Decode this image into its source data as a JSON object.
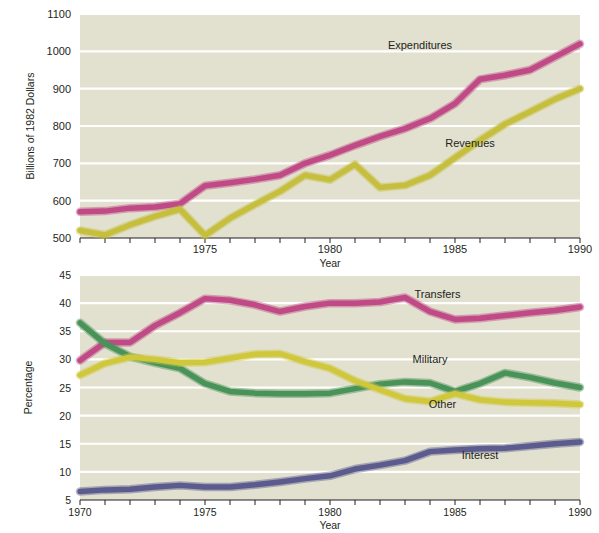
{
  "figure": {
    "background_color": "#ffffff",
    "panel_color": "#e2e0cf",
    "gridline_color": "#ffffff",
    "text_color": "#231f20"
  },
  "chart_data": [
    {
      "type": "line",
      "panel": "top",
      "title": "",
      "xlabel": "Year",
      "ylabel": "Billions of 1982 Dollars",
      "xlim": [
        1970,
        1990
      ],
      "ylim": [
        500,
        1100
      ],
      "xticks": [
        1970,
        1971,
        1972,
        1973,
        1974,
        1975,
        1976,
        1977,
        1978,
        1979,
        1980,
        1981,
        1982,
        1983,
        1984,
        1985,
        1986,
        1987,
        1988,
        1989,
        1990
      ],
      "xticklabels": [
        "",
        "",
        "",
        "",
        "",
        "1975",
        "",
        "",
        "",
        "",
        "1980",
        "",
        "",
        "",
        "",
        "1985",
        "",
        "",
        "",
        "",
        "1990"
      ],
      "yticks": [
        500,
        600,
        700,
        800,
        900,
        1000,
        1100
      ],
      "yticklabels": [
        "500",
        "600",
        "700",
        "800",
        "900",
        "1000",
        "1100"
      ],
      "grid": true,
      "x": [
        1970,
        1971,
        1972,
        1973,
        1974,
        1975,
        1976,
        1977,
        1978,
        1979,
        1980,
        1981,
        1982,
        1983,
        1984,
        1985,
        1986,
        1987,
        1988,
        1989,
        1990
      ],
      "series": [
        {
          "name": "Expenditures",
          "color": "#bf4a86",
          "label_x": 1983.6,
          "label_y": 1005,
          "values": [
            570,
            572,
            580,
            583,
            592,
            640,
            648,
            657,
            668,
            700,
            722,
            748,
            772,
            793,
            820,
            860,
            925,
            936,
            950,
            985,
            1020
          ]
        },
        {
          "name": "Revenues",
          "color": "#c5bf3d",
          "label_x": 1985.6,
          "label_y": 745,
          "values": [
            520,
            508,
            535,
            558,
            577,
            507,
            553,
            590,
            625,
            668,
            656,
            697,
            635,
            641,
            668,
            715,
            762,
            805,
            838,
            872,
            900
          ]
        }
      ]
    },
    {
      "type": "line",
      "panel": "bottom",
      "title": "",
      "xlabel": "Year",
      "ylabel": "Percentage",
      "xlim": [
        1970,
        1990
      ],
      "ylim": [
        5,
        45
      ],
      "xticks": [
        1970,
        1971,
        1972,
        1973,
        1974,
        1975,
        1976,
        1977,
        1978,
        1979,
        1980,
        1981,
        1982,
        1983,
        1984,
        1985,
        1986,
        1987,
        1988,
        1989,
        1990
      ],
      "xticklabels": [
        "1970",
        "",
        "",
        "",
        "",
        "1975",
        "",
        "",
        "",
        "",
        "1980",
        "",
        "",
        "",
        "",
        "1985",
        "",
        "",
        "",
        "",
        "1990"
      ],
      "yticks": [
        5,
        10,
        15,
        20,
        25,
        30,
        35,
        40,
        45
      ],
      "yticklabels": [
        "5",
        "10",
        "15",
        "20",
        "25",
        "30",
        "35",
        "40",
        "45"
      ],
      "grid": true,
      "x": [
        1970,
        1971,
        1972,
        1973,
        1974,
        1975,
        1976,
        1977,
        1978,
        1979,
        1980,
        1981,
        1982,
        1983,
        1984,
        1985,
        1986,
        1987,
        1988,
        1989,
        1990
      ],
      "series": [
        {
          "name": "Transfers",
          "color": "#bf4a86",
          "label_x": 1984.3,
          "label_y": 41.0,
          "values": [
            29.8,
            33.0,
            33.0,
            36.0,
            38.3,
            40.8,
            40.5,
            39.7,
            38.5,
            39.4,
            40.0,
            40.0,
            40.2,
            41.0,
            38.5,
            37.1,
            37.3,
            37.8,
            38.3,
            38.7,
            39.3
          ]
        },
        {
          "name": "Military",
          "color": "#4a9358",
          "label_x": 1984.0,
          "label_y": 29.3,
          "values": [
            36.5,
            32.8,
            30.5,
            29.4,
            28.4,
            25.7,
            24.3,
            24.0,
            23.9,
            23.9,
            24.0,
            24.8,
            25.6,
            26.0,
            25.8,
            24.3,
            25.7,
            27.6,
            26.8,
            25.8,
            25.0
          ]
        },
        {
          "name": "Other",
          "color": "#d0c83c",
          "label_x": 1984.5,
          "label_y": 21.3,
          "values": [
            27.2,
            29.3,
            30.4,
            30.0,
            29.4,
            29.5,
            30.2,
            30.9,
            31.0,
            29.6,
            28.4,
            26.2,
            24.6,
            23.0,
            22.5,
            23.9,
            22.8,
            22.4,
            22.3,
            22.2,
            22.0
          ]
        },
        {
          "name": "Interest",
          "color": "#5c5b8e",
          "label_x": 1986.0,
          "label_y": 12.3,
          "values": [
            6.5,
            6.8,
            6.9,
            7.3,
            7.6,
            7.3,
            7.3,
            7.7,
            8.2,
            8.8,
            9.3,
            10.5,
            11.2,
            12.0,
            13.6,
            13.9,
            14.1,
            14.2,
            14.6,
            15.0,
            15.3
          ]
        }
      ]
    }
  ]
}
